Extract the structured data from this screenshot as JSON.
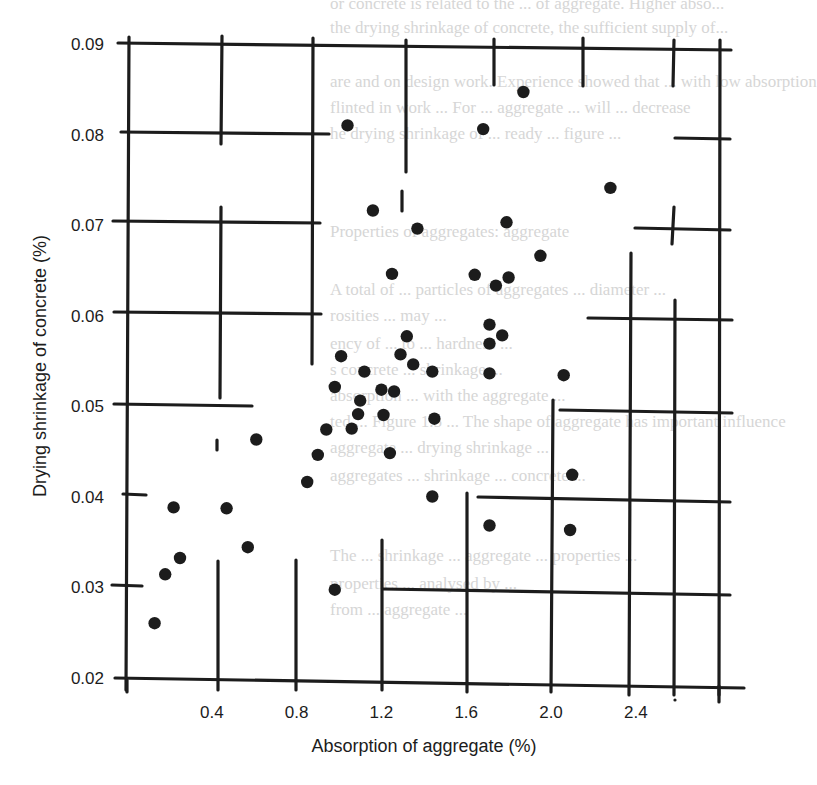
{
  "chart_data": {
    "type": "scatter",
    "title": "",
    "xlabel": "Absorption of aggregate (%)",
    "ylabel": "Drying shrinkage of concrete (%)",
    "xlim": [
      0,
      2.6
    ],
    "ylim": [
      0.02,
      0.09
    ],
    "xticks": [
      0.4,
      0.8,
      1.2,
      1.6,
      2.0,
      2.4
    ],
    "xtick_labels": [
      "0.4",
      "0.8",
      "1.2",
      "1.6",
      "2.0",
      "2.4"
    ],
    "yticks": [
      0.02,
      0.03,
      0.04,
      0.05,
      0.06,
      0.07,
      0.08,
      0.09
    ],
    "ytick_labels": [
      "0.02",
      "0.03",
      "0.04",
      "0.05",
      "0.06",
      "0.07",
      "0.08",
      "0.09"
    ],
    "grid": "partial (broken grid lines, as in printed figure)",
    "legend": null,
    "series": [
      {
        "name": "Observations",
        "points": [
          [
            0.13,
            0.026
          ],
          [
            0.18,
            0.0314
          ],
          [
            0.22,
            0.0388
          ],
          [
            0.25,
            0.0332
          ],
          [
            0.47,
            0.0387
          ],
          [
            0.57,
            0.0344
          ],
          [
            0.61,
            0.0463
          ],
          [
            0.85,
            0.0416
          ],
          [
            0.9,
            0.0446
          ],
          [
            0.94,
            0.0474
          ],
          [
            0.98,
            0.0521
          ],
          [
            0.98,
            0.0297
          ],
          [
            1.01,
            0.0555
          ],
          [
            1.04,
            0.081
          ],
          [
            1.06,
            0.0475
          ],
          [
            1.09,
            0.0491
          ],
          [
            1.1,
            0.0506
          ],
          [
            1.12,
            0.0538
          ],
          [
            1.16,
            0.0716
          ],
          [
            1.2,
            0.0518
          ],
          [
            1.21,
            0.049
          ],
          [
            1.24,
            0.0448
          ],
          [
            1.25,
            0.0646
          ],
          [
            1.26,
            0.0516
          ],
          [
            1.29,
            0.0557
          ],
          [
            1.32,
            0.0577
          ],
          [
            1.35,
            0.0546
          ],
          [
            1.37,
            0.0696
          ],
          [
            1.44,
            0.04
          ],
          [
            1.45,
            0.0486
          ],
          [
            1.44,
            0.0538
          ],
          [
            1.64,
            0.0645
          ],
          [
            1.68,
            0.0806
          ],
          [
            1.71,
            0.0569
          ],
          [
            1.71,
            0.059
          ],
          [
            1.71,
            0.0536
          ],
          [
            1.71,
            0.0368
          ],
          [
            1.74,
            0.0633
          ],
          [
            1.77,
            0.0578
          ],
          [
            1.79,
            0.0703
          ],
          [
            1.8,
            0.0642
          ],
          [
            1.87,
            0.0847
          ],
          [
            1.95,
            0.0666
          ],
          [
            2.06,
            0.0534
          ],
          [
            2.1,
            0.0424
          ],
          [
            2.09,
            0.0363
          ],
          [
            2.28,
            0.0741
          ]
        ]
      }
    ]
  },
  "page": {
    "background_text": [
      "or concrete is related to the ... of aggregate. Higher abso...",
      "the drying shrinkage of concrete, the sufficient supply of...",
      "are and on design work. Experience showed that ... with low absorption",
      "flinted in work ... For ... aggregate ... will ... decrease",
      "he drying shrinkage of ... ready ... figure ...",
      "Properties of aggregates: aggregate",
      "A total of ... particles of aggregates ... diameter ...",
      "rosities ... may ...",
      "ency of ... to ... hardness ...",
      "s concrete ... shrinkage ...",
      "absorption ... with the aggregate ...",
      "ted ... Figure 1.5 ... The shape of aggregate has important influence",
      "aggregate ... drying shrinkage ...",
      "aggregates ... shrinkage ... concrete ...",
      "The ... shrinkage ... aggregate ... properties ...",
      "properties ... analysed by ...",
      "from ... aggregate ..."
    ]
  },
  "style": {
    "ink": "#1c1c1c",
    "paper": "#ffffff",
    "ghost_text": "#d6d6d6"
  }
}
